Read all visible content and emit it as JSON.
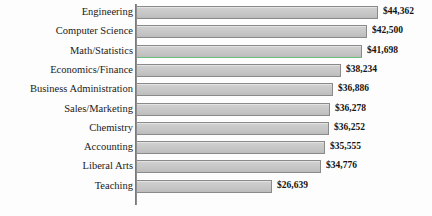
{
  "chart_data": {
    "type": "bar",
    "orientation": "horizontal",
    "title": "",
    "subtitle": "",
    "xlabel": "",
    "ylabel": "",
    "grid": false,
    "legend": "none",
    "axis_visible": {
      "category_axis": true,
      "value_axis": false
    },
    "value_prefix": "$",
    "categories": [
      "Engineering",
      "Computer Science",
      "Math/Statistics",
      "Economics/Finance",
      "Business Administration",
      "Sales/Marketing",
      "Chemistry",
      "Accounting",
      "Liberal Arts",
      "Teaching"
    ],
    "values": [
      44362,
      42500,
      41698,
      38234,
      36886,
      36278,
      36252,
      35555,
      34776,
      26639
    ],
    "value_labels": [
      "$44,362",
      "$42,500",
      "$41,698",
      "$38,234",
      "$36,886",
      "$36,278",
      "$36,252",
      "$35,555",
      "$34,776",
      "$26,639"
    ],
    "xlim": [
      4070,
      44362
    ],
    "bar_fill_color": "#c8c8c8",
    "bar_border_color": "#8a8a8a",
    "axis_color": "#8d8d8d",
    "label_color": "#1a1a1a",
    "artifact": {
      "name": "green-scan-line",
      "color": "#63c878",
      "after_category": "Math/Statistics"
    }
  }
}
